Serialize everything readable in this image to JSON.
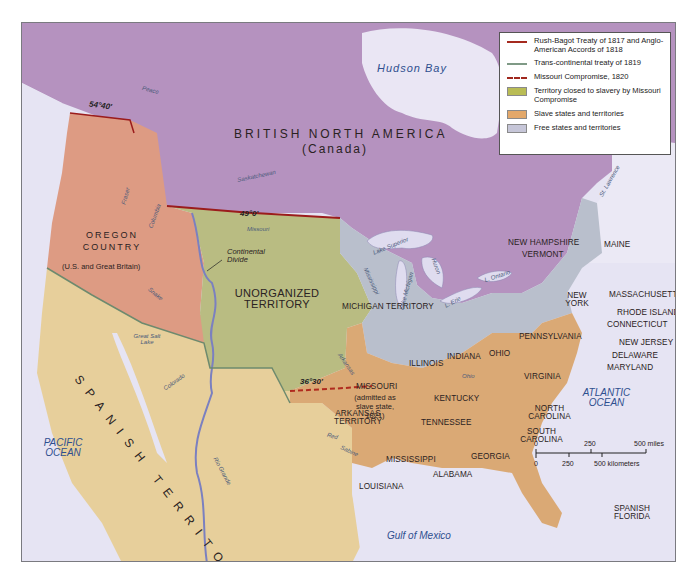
{
  "map": {
    "title_region": "BRITISH NORTH AMERICA",
    "title_region_sub": "(Canada)",
    "colors": {
      "british": "#b592bf",
      "oregon": "#dd9b83",
      "spanish": "#e7cf9b",
      "unorganized": "#b9bc82",
      "slave": "#daa975",
      "free": "#b9bfcc",
      "water": "#e6e4f3",
      "treaty_red": "#9b1c1c",
      "transcontinental": "#6e8a6e",
      "river": "#7b80c0"
    },
    "legend": {
      "items": [
        {
          "type": "line",
          "color": "#a52a1f",
          "label": "Rush-Bagot Treaty of 1817 and Anglo-American Accords of 1818"
        },
        {
          "type": "line",
          "color": "#7f9a86",
          "label": "Trans-continental treaty of 1819"
        },
        {
          "type": "dash",
          "color": "#a0281e",
          "label": "Missouri Compromise, 1820"
        },
        {
          "type": "swatch",
          "color": "#b9bc55",
          "label": "Territory closed to slavery by Missouri Compromise"
        },
        {
          "type": "swatch",
          "color": "#e3a86a",
          "label": "Slave states and territories"
        },
        {
          "type": "swatch",
          "color": "#c6c6d8",
          "label": "Free states and territories"
        }
      ]
    },
    "water_labels": {
      "hudson_bay": "Hudson Bay",
      "pacific": "PACIFIC OCEAN",
      "atlantic": "ATLANTIC OCEAN",
      "gulf": "Gulf of Mexico"
    },
    "territories": {
      "oregon": "OREGON COUNTRY",
      "oregon_sub": "(U.S. and Great Britain)",
      "unorganized": "UNORGANIZED TERRITORY",
      "spanish": "SPANISH TERRITORY",
      "michigan": "MICHIGAN TERRITORY",
      "arkansas": "ARKANSAS TERRITORY",
      "spanish_florida": "SPANISH FLORIDA"
    },
    "states": {
      "maine": "MAINE",
      "new_hampshire": "NEW HAMPSHIRE",
      "vermont": "VERMONT",
      "massachusetts": "MASSACHUSETTS",
      "rhode_island": "RHODE ISLAND",
      "connecticut": "CONNECTICUT",
      "new_york": "NEW YORK",
      "new_jersey": "NEW JERSEY",
      "delaware": "DELAWARE",
      "maryland": "MARYLAND",
      "pennsylvania": "PENNSYLVANIA",
      "ohio": "OHIO",
      "indiana": "INDIANA",
      "illinois": "ILLINOIS",
      "missouri": "MISSOURI",
      "missouri_note": "(admitted as slave state, 1821)",
      "virginia": "VIRGINIA",
      "kentucky": "KENTUCKY",
      "tennessee": "TENNESSEE",
      "north_carolina": "NORTH CAROLINA",
      "south_carolina": "SOUTH CAROLINA",
      "georgia": "GEORGIA",
      "alabama": "ALABAMA",
      "mississippi": "MISSISSIPPI",
      "louisiana": "LOUISIANA"
    },
    "features": {
      "continental_divide": "Continental Divide",
      "lat_5440": "54°40'",
      "lat_490": "49°0'",
      "lat_3630": "36°30'"
    },
    "rivers": {
      "peace": "Peace",
      "saskatchewan": "Saskatchewan",
      "fraser": "Fraser",
      "columbia": "Columbia",
      "snake": "Snake",
      "missouri": "Missouri",
      "mississippi": "Mississippi",
      "arkansas": "Arkansas",
      "red": "Red",
      "sabine": "Sabine",
      "colorado": "Colorado",
      "rio_grande": "Rio Grande",
      "ohio": "Ohio",
      "st_lawrence": "St. Lawrence",
      "great_salt_lake": "Great Salt Lake"
    },
    "lakes": {
      "superior": "Lake Superior",
      "michigan": "Lake Michigan",
      "huron": "Huron",
      "erie": "L. Erie",
      "ontario": "L. Ontario"
    },
    "scale": {
      "miles": [
        "0",
        "250",
        "500 miles"
      ],
      "km": [
        "0",
        "250",
        "500 kilometers"
      ]
    }
  }
}
